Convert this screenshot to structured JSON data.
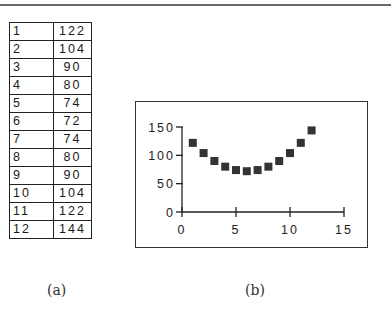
{
  "table": {
    "rows": [
      {
        "x": "1",
        "y": "122"
      },
      {
        "x": "2",
        "y": "104"
      },
      {
        "x": "3",
        "y": "90"
      },
      {
        "x": "4",
        "y": "80"
      },
      {
        "x": "5",
        "y": "74"
      },
      {
        "x": "6",
        "y": "72"
      },
      {
        "x": "7",
        "y": "74"
      },
      {
        "x": "8",
        "y": "80"
      },
      {
        "x": "9",
        "y": "90"
      },
      {
        "x": "10",
        "y": "104"
      },
      {
        "x": "11",
        "y": "122"
      },
      {
        "x": "12",
        "y": "144"
      }
    ]
  },
  "captions": {
    "a": "(a)",
    "b": "(b)"
  },
  "chart_data": {
    "type": "scatter",
    "title": "",
    "xlabel": "",
    "ylabel": "",
    "x": [
      1,
      2,
      3,
      4,
      5,
      6,
      7,
      8,
      9,
      10,
      11,
      12
    ],
    "y": [
      122,
      104,
      90,
      80,
      74,
      72,
      74,
      80,
      90,
      104,
      122,
      144
    ],
    "xlim": [
      0,
      15
    ],
    "ylim": [
      0,
      150
    ],
    "x_ticks": [
      "0",
      "5",
      "10",
      "15"
    ],
    "y_ticks": [
      "0",
      "50",
      "100",
      "150"
    ],
    "marker": "square",
    "marker_color": "#333333",
    "grid": false,
    "legend": null
  }
}
